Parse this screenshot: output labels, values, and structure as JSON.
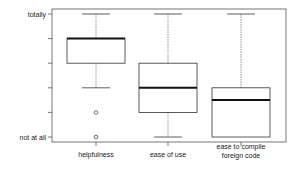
{
  "chart_data": {
    "type": "boxplot",
    "title": "",
    "xlabel": "",
    "ylabel": "",
    "categories": [
      "helpfulness",
      "ease of use",
      "ease to compile\nforeign code"
    ],
    "y_tick_labels": [
      "not at all",
      "",
      "",
      "",
      "",
      "totally"
    ],
    "ylim": [
      0,
      5
    ],
    "grid": false,
    "boxes": [
      {
        "name": "helpfulness",
        "whisker_low": 2,
        "q1": 3,
        "median": 4,
        "q3": 4,
        "whisker_high": 5,
        "outliers": [
          1,
          0
        ]
      },
      {
        "name": "ease of use",
        "whisker_low": 0,
        "q1": 1,
        "median": 2,
        "q3": 3,
        "whisker_high": 5,
        "outliers": []
      },
      {
        "name": "ease to compile foreign code",
        "whisker_low": 0,
        "q1": 0,
        "median": 1.5,
        "q3": 2,
        "whisker_high": 5,
        "outliers": []
      }
    ]
  },
  "labels": {
    "y_top": "totally",
    "y_bottom": "not at all",
    "x1": "helpfulness",
    "x2": "ease of use",
    "x3_line1": "ease to compile",
    "x3_line2": "foreign code"
  },
  "colors": {
    "frame": "#555555",
    "box": "#333333",
    "median": "#111111",
    "whisker": "#666666"
  }
}
